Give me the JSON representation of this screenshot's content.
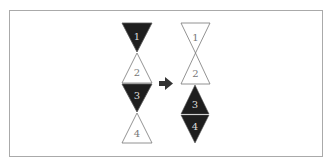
{
  "diagram": {
    "colors": {
      "dark": "#1e1e1e",
      "outline": "#777777",
      "dark_label": "#dddddd",
      "light_label": "#777777",
      "arrow": "#333333"
    },
    "before": {
      "triangles": [
        {
          "label": "1",
          "orientation": "down",
          "fill": "dark"
        },
        {
          "label": "2",
          "orientation": "up",
          "fill": "white"
        },
        {
          "label": "3",
          "orientation": "down",
          "fill": "dark"
        },
        {
          "label": "4",
          "orientation": "up",
          "fill": "white"
        }
      ]
    },
    "arrow": {
      "direction": "right"
    },
    "after": {
      "triangles": [
        {
          "label": "1",
          "orientation": "down",
          "fill": "white"
        },
        {
          "label": "2",
          "orientation": "up",
          "fill": "white"
        },
        {
          "label": "3",
          "orientation": "up",
          "fill": "dark"
        },
        {
          "label": "4",
          "orientation": "down",
          "fill": "dark"
        }
      ]
    }
  }
}
